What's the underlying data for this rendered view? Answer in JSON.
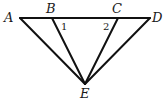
{
  "diagram": {
    "type": "geometry",
    "points": {
      "A": {
        "label": "A",
        "x": 20,
        "y": 18
      },
      "B": {
        "label": "B",
        "x": 52,
        "y": 18
      },
      "C": {
        "label": "C",
        "x": 118,
        "y": 18
      },
      "D": {
        "label": "D",
        "x": 150,
        "y": 18
      },
      "E": {
        "label": "E",
        "x": 85,
        "y": 84
      }
    },
    "segments": [
      "AD",
      "AE",
      "BE",
      "CE",
      "DE"
    ],
    "angles": [
      {
        "label": "1",
        "vertex": "B"
      },
      {
        "label": "2",
        "vertex": "C"
      }
    ],
    "colors": {
      "stroke": "#111111",
      "background": "#ffffff"
    }
  }
}
